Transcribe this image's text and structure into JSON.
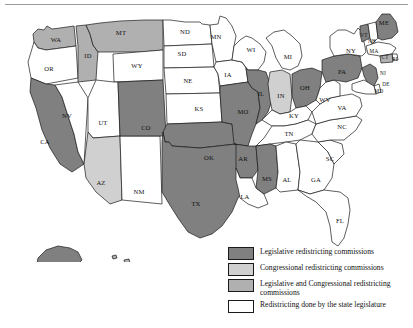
{
  "figure": {
    "kind": "choropleth-map",
    "region": "United States"
  },
  "legend": {
    "items": [
      {
        "label": "Legislative redistricting commissions",
        "color": "#808080",
        "key": "legislative"
      },
      {
        "label": "Congressional redistricting commissions",
        "color": "#d0d0d0",
        "key": "congressional"
      },
      {
        "label": "Legislative and Congressional redistricting commissions",
        "color": "#b0b0b0",
        "key": "both"
      },
      {
        "label": "Redistricting done by the state legislature",
        "color": "#ffffff",
        "key": "legislature"
      }
    ]
  },
  "chart_data": {
    "type": "map",
    "title": "",
    "categories": [
      "Legislative redistricting commissions",
      "Congressional redistricting commissions",
      "Legislative and Congressional redistricting commissions",
      "Redistricting done by the state legislature"
    ],
    "category_colors": [
      "#808080",
      "#d0d0d0",
      "#b0b0b0",
      "#ffffff"
    ],
    "counts": {
      "legislative": 14,
      "congressional": 2,
      "both": 5,
      "legislature": 30
    },
    "states": [
      {
        "code": "WA",
        "category": "both"
      },
      {
        "code": "OR",
        "category": "legislature"
      },
      {
        "code": "CA",
        "category": "legislative"
      },
      {
        "code": "NV",
        "category": "legislature"
      },
      {
        "code": "ID",
        "category": "both"
      },
      {
        "code": "MT",
        "category": "both"
      },
      {
        "code": "WY",
        "category": "legislature"
      },
      {
        "code": "UT",
        "category": "legislature"
      },
      {
        "code": "AZ",
        "category": "congressional"
      },
      {
        "code": "NM",
        "category": "legislature"
      },
      {
        "code": "CO",
        "category": "legislative"
      },
      {
        "code": "ND",
        "category": "legislature"
      },
      {
        "code": "SD",
        "category": "legislature"
      },
      {
        "code": "NE",
        "category": "legislature"
      },
      {
        "code": "KS",
        "category": "legislature"
      },
      {
        "code": "OK",
        "category": "legislative"
      },
      {
        "code": "TX",
        "category": "legislative"
      },
      {
        "code": "MN",
        "category": "legislature"
      },
      {
        "code": "IA",
        "category": "legislature"
      },
      {
        "code": "MO",
        "category": "legislative"
      },
      {
        "code": "AR",
        "category": "legislative"
      },
      {
        "code": "LA",
        "category": "legislature"
      },
      {
        "code": "WI",
        "category": "legislature"
      },
      {
        "code": "IL",
        "category": "legislative"
      },
      {
        "code": "IN",
        "category": "congressional"
      },
      {
        "code": "MI",
        "category": "legislature"
      },
      {
        "code": "OH",
        "category": "legislative"
      },
      {
        "code": "KY",
        "category": "legislature"
      },
      {
        "code": "TN",
        "category": "legislature"
      },
      {
        "code": "MS",
        "category": "legislative"
      },
      {
        "code": "AL",
        "category": "legislature"
      },
      {
        "code": "GA",
        "category": "legislature"
      },
      {
        "code": "FL",
        "category": "legislature"
      },
      {
        "code": "SC",
        "category": "legislature"
      },
      {
        "code": "NC",
        "category": "legislature"
      },
      {
        "code": "VA",
        "category": "legislature"
      },
      {
        "code": "WV",
        "category": "legislature"
      },
      {
        "code": "PA",
        "category": "legislative"
      },
      {
        "code": "NY",
        "category": "legislature"
      },
      {
        "code": "VT",
        "category": "legislative"
      },
      {
        "code": "NH",
        "category": "legislature"
      },
      {
        "code": "ME",
        "category": "legislative"
      },
      {
        "code": "MA",
        "category": "legislature"
      },
      {
        "code": "RI",
        "category": "legislature"
      },
      {
        "code": "CT",
        "category": "both"
      },
      {
        "code": "NJ",
        "category": "legislative"
      },
      {
        "code": "DE",
        "category": "legislature"
      },
      {
        "code": "MD",
        "category": "legislature"
      },
      {
        "code": "AK",
        "category": "legislative"
      },
      {
        "code": "HI",
        "category": "both"
      }
    ],
    "labels": [
      {
        "code": "WA",
        "x": 56,
        "y": 28
      },
      {
        "code": "OR",
        "x": 49,
        "y": 57
      },
      {
        "code": "CA",
        "x": 45,
        "y": 130
      },
      {
        "code": "NV",
        "x": 67,
        "y": 104
      },
      {
        "code": "ID",
        "x": 88,
        "y": 44
      },
      {
        "code": "MT",
        "x": 121,
        "y": 21
      },
      {
        "code": "WY",
        "x": 137,
        "y": 54
      },
      {
        "code": "UT",
        "x": 103,
        "y": 111
      },
      {
        "code": "AZ",
        "x": 101,
        "y": 171
      },
      {
        "code": "NM",
        "x": 139,
        "y": 180
      },
      {
        "code": "CO",
        "x": 146,
        "y": 116
      },
      {
        "code": "ND",
        "x": 185,
        "y": 20
      },
      {
        "code": "SD",
        "x": 182,
        "y": 42
      },
      {
        "code": "NE",
        "x": 188,
        "y": 69
      },
      {
        "code": "KS",
        "x": 199,
        "y": 97
      },
      {
        "code": "OK",
        "x": 209,
        "y": 146
      },
      {
        "code": "TX",
        "x": 196,
        "y": 192
      },
      {
        "code": "MN",
        "x": 216,
        "y": 25
      },
      {
        "code": "IA",
        "x": 228,
        "y": 63
      },
      {
        "code": "MO",
        "x": 243,
        "y": 100
      },
      {
        "code": "AR",
        "x": 243,
        "y": 147
      },
      {
        "code": "LA",
        "x": 245,
        "y": 185
      },
      {
        "code": "WI",
        "x": 251,
        "y": 38
      },
      {
        "code": "IL",
        "x": 261,
        "y": 82
      },
      {
        "code": "IN",
        "x": 281,
        "y": 84
      },
      {
        "code": "MI",
        "x": 288,
        "y": 45
      },
      {
        "code": "OH",
        "x": 305,
        "y": 76
      },
      {
        "code": "KY",
        "x": 294,
        "y": 104
      },
      {
        "code": "TN",
        "x": 289,
        "y": 122
      },
      {
        "code": "MS",
        "x": 267,
        "y": 167
      },
      {
        "code": "AL",
        "x": 287,
        "y": 168
      },
      {
        "code": "GA",
        "x": 316,
        "y": 168
      },
      {
        "code": "FL",
        "x": 340,
        "y": 209
      },
      {
        "code": "SC",
        "x": 330,
        "y": 147
      },
      {
        "code": "NC",
        "x": 342,
        "y": 115
      },
      {
        "code": "VA",
        "x": 342,
        "y": 96
      },
      {
        "code": "WV",
        "x": 325,
        "y": 88
      },
      {
        "code": "PA",
        "x": 342,
        "y": 60
      },
      {
        "code": "NY",
        "x": 351,
        "y": 39
      },
      {
        "code": "VT",
        "x": 364,
        "y": 24
      },
      {
        "code": "NH",
        "x": 372,
        "y": 30
      },
      {
        "code": "ME",
        "x": 384,
        "y": 11
      },
      {
        "code": "MA",
        "x": 374,
        "y": 40
      },
      {
        "code": "RI",
        "x": 395,
        "y": 48
      },
      {
        "code": "CT",
        "x": 385,
        "y": 46
      },
      {
        "code": "NJ",
        "x": 383,
        "y": 62
      },
      {
        "code": "DE",
        "x": 386,
        "y": 73
      },
      {
        "code": "MD",
        "x": 379,
        "y": 80
      },
      {
        "code": "AK",
        "x": 59,
        "y": 284
      },
      {
        "code": "HI",
        "x": 143,
        "y": 272
      }
    ]
  }
}
